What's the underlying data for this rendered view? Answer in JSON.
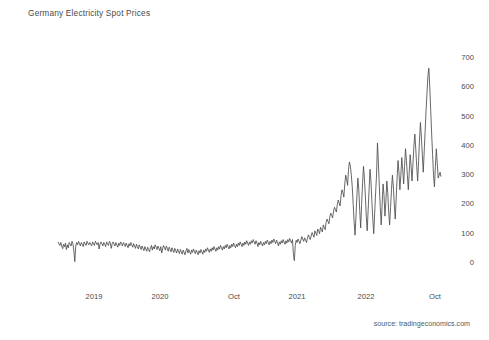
{
  "chart_data": {
    "type": "line",
    "title": "Germany Electricity Spot Prices",
    "xlabel": "",
    "ylabel": "",
    "ylim": [
      0,
      700
    ],
    "yticks": [
      0,
      100,
      200,
      300,
      400,
      500,
      600,
      700
    ],
    "ytick_labels": [
      "0",
      "100",
      "200",
      "300",
      "400",
      "500",
      "600",
      "700"
    ],
    "xtick_labels": [
      "2019",
      "2020",
      "Oct",
      "2021",
      "2022",
      "Oct"
    ],
    "xtick_positions": [
      94,
      160,
      234,
      297,
      366,
      435
    ],
    "grid": false,
    "legend": null,
    "line_color": "#4d4d4d",
    "line_width": 0.85,
    "source": "source: tradingeconomics.com",
    "series": [
      {
        "name": "Germany Electricity Spot Price (EUR/MWh)",
        "x_start_px": 58,
        "x_end_px": 441,
        "values": [
          72,
          66,
          60,
          70,
          58,
          49,
          64,
          55,
          68,
          46,
          62,
          52,
          70,
          64,
          58,
          74,
          66,
          40,
          5,
          58,
          70,
          62,
          74,
          66,
          58,
          70,
          64,
          56,
          72,
          66,
          60,
          74,
          68,
          62,
          70,
          64,
          58,
          72,
          66,
          60,
          74,
          68,
          62,
          70,
          48,
          64,
          72,
          66,
          58,
          70,
          64,
          56,
          72,
          66,
          60,
          74,
          68,
          50,
          66,
          72,
          64,
          58,
          70,
          62,
          54,
          68,
          60,
          72,
          66,
          58,
          70,
          64,
          56,
          68,
          60,
          52,
          66,
          58,
          70,
          62,
          54,
          66,
          58,
          50,
          64,
          56,
          48,
          62,
          54,
          46,
          58,
          50,
          42,
          56,
          48,
          40,
          54,
          46,
          38,
          52,
          60,
          44,
          56,
          48,
          62,
          54,
          46,
          58,
          50,
          42,
          56,
          34,
          48,
          60,
          52,
          44,
          58,
          50,
          40,
          54,
          46,
          38,
          52,
          44,
          36,
          50,
          42,
          34,
          48,
          40,
          32,
          46,
          38,
          30,
          44,
          36,
          28,
          42,
          50,
          34,
          46,
          38,
          30,
          44,
          36,
          48,
          40,
          32,
          44,
          36,
          28,
          42,
          34,
          46,
          38,
          30,
          44,
          36,
          48,
          40,
          52,
          44,
          36,
          48,
          40,
          52,
          44,
          56,
          48,
          40,
          52,
          44,
          56,
          48,
          60,
          52,
          44,
          56,
          48,
          60,
          52,
          64,
          56,
          48,
          60,
          52,
          64,
          56,
          68,
          60,
          52,
          64,
          56,
          68,
          60,
          72,
          64,
          56,
          68,
          60,
          72,
          64,
          76,
          68,
          60,
          72,
          64,
          76,
          68,
          80,
          72,
          64,
          76,
          68,
          56,
          70,
          62,
          74,
          66,
          58,
          70,
          62,
          74,
          66,
          78,
          70,
          62,
          74,
          66,
          78,
          70,
          82,
          74,
          66,
          78,
          70,
          58,
          72,
          64,
          76,
          68,
          80,
          72,
          64,
          76,
          68,
          80,
          72,
          84,
          76,
          68,
          80,
          30,
          8,
          60,
          78,
          70,
          82,
          74,
          66,
          78,
          90,
          82,
          74,
          86,
          78,
          70,
          84,
          96,
          88,
          80,
          92,
          104,
          96,
          88,
          110,
          102,
          94,
          116,
          108,
          100,
          122,
          114,
          106,
          130,
          122,
          114,
          138,
          150,
          142,
          134,
          158,
          170,
          162,
          154,
          178,
          190,
          182,
          174,
          200,
          215,
          205,
          195,
          230,
          250,
          240,
          225,
          270,
          300,
          285,
          265,
          320,
          345,
          330,
          300,
          260,
          200,
          140,
          95,
          160,
          230,
          290,
          250,
          180,
          120,
          200,
          270,
          330,
          290,
          230,
          160,
          110,
          180,
          250,
          320,
          280,
          210,
          150,
          100,
          170,
          240,
          300,
          410,
          340,
          260,
          190,
          130,
          200,
          270,
          230,
          160,
          210,
          280,
          240,
          175,
          130,
          190,
          250,
          300,
          260,
          200,
          150,
          220,
          290,
          350,
          310,
          250,
          300,
          360,
          320,
          270,
          330,
          390,
          350,
          300,
          250,
          310,
          370,
          330,
          280,
          340,
          400,
          440,
          390,
          330,
          280,
          350,
          420,
          480,
          430,
          370,
          310,
          380,
          450,
          520,
          580,
          640,
          665,
          600,
          520,
          440,
          370,
          300,
          260,
          330,
          390,
          340,
          290,
          300,
          310,
          295
        ]
      }
    ],
    "annotations": [
      {
        "label": "minimum-spike-2019",
        "approx_value": 5
      },
      {
        "label": "minimum-spike-2021",
        "approx_value": 8
      },
      {
        "label": "maximum-peak-2022",
        "approx_value": 665
      },
      {
        "label": "series-end-value",
        "approx_value": 295
      }
    ]
  }
}
